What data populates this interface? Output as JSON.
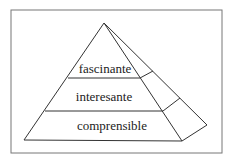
{
  "diagram": {
    "type": "pyramid",
    "levels": [
      {
        "label": "fascinante",
        "position": "top"
      },
      {
        "label": "interesante",
        "position": "middle"
      },
      {
        "label": "comprensible",
        "position": "bottom"
      }
    ]
  },
  "colors": {
    "stroke": "#333333",
    "frame": "#777777",
    "background": "#ffffff"
  }
}
